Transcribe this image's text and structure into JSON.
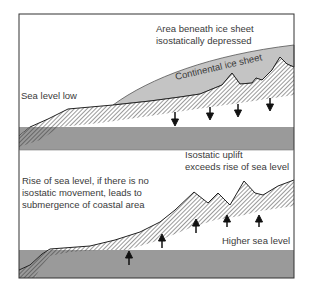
{
  "colors": {
    "sea": "#9a9a9a",
    "ice": "#c4c4c4",
    "hatch": "#555555",
    "frame": "#333333",
    "arrow": "#111111"
  },
  "top_panel": {
    "ice_label_line1": "Area beneath ice sheet",
    "ice_label_line2": "isostatically depressed",
    "ice_sheet_label": "Continental ice sheet",
    "sea_label": "Sea level low",
    "arrows": "down"
  },
  "bottom_panel": {
    "uplift_label_line1": "Isostatic uplift",
    "uplift_label_line2": "exceeds rise of sea level",
    "rise_label_line1": "Rise of sea level, if there is no",
    "rise_label_line2": "isostatic movement, leads to",
    "rise_label_line3": "submergence of coastal area",
    "sea_label": "Higher sea level",
    "arrows": "up"
  }
}
